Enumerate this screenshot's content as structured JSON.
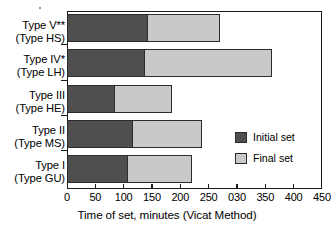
{
  "chart_data": {
    "type": "bar",
    "orientation": "horizontal",
    "stacked": true,
    "title": "",
    "xlabel": "Time of set, minutes (Vicat Method)",
    "ylabel": "",
    "xlim": [
      0,
      450
    ],
    "xticks": [
      0,
      50,
      100,
      150,
      200,
      250,
      300,
      350,
      400,
      450
    ],
    "xticklabels": [
      "0",
      "50",
      "100",
      "150",
      "200",
      "250",
      "030",
      "350",
      "400",
      "450"
    ],
    "grid": false,
    "legend_position": "inside-right",
    "categories": [
      {
        "line1": "Type I",
        "line2": "(Type GU)"
      },
      {
        "line1": "Type II",
        "line2": "(Type MS)"
      },
      {
        "line1": "Type III",
        "line2": "(Type HE)"
      },
      {
        "line1": "Type IV*",
        "line2": "(Type LH)"
      },
      {
        "line1": "Type V**",
        "line2": "(Type HS)"
      }
    ],
    "series": [
      {
        "name": "Initial set",
        "color": "#4f4f4f",
        "values": [
          108,
          117,
          85,
          138,
          143
        ]
      },
      {
        "name": "Final set",
        "color": "#c9c9c9",
        "values": [
          113,
          121,
          100,
          224,
          127
        ]
      }
    ],
    "totals": [
      221,
      238,
      185,
      362,
      270
    ]
  },
  "legend": {
    "items": [
      {
        "label": "Initial set",
        "color": "#4f4f4f"
      },
      {
        "label": "Final set",
        "color": "#c9c9c9"
      }
    ]
  }
}
